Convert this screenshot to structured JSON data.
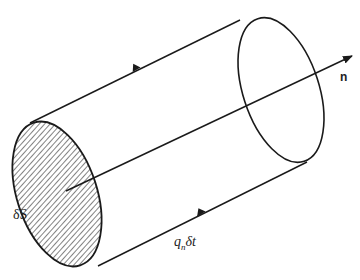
{
  "diagram": {
    "labels": {
      "normal": "n",
      "surface_element": "δS",
      "length_base": "q",
      "length_sub": "n",
      "length_rest": "δt"
    },
    "colors": {
      "stroke": "#1a1a1a",
      "hatch": "#1a1a1a",
      "background": "#ffffff"
    }
  }
}
